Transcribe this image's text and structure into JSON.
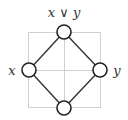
{
  "diagram": {
    "type": "hasse-diagram",
    "nodes": [
      {
        "id": "top",
        "label": "x ∨ y",
        "cx": 64,
        "cy": 32
      },
      {
        "id": "left",
        "label": "x",
        "cx": 29,
        "cy": 70
      },
      {
        "id": "right",
        "label": "y",
        "cx": 100,
        "cy": 70
      },
      {
        "id": "bottom",
        "label": "",
        "cx": 64,
        "cy": 108
      }
    ],
    "edges": [
      [
        "top",
        "left"
      ],
      [
        "top",
        "right"
      ],
      [
        "left",
        "bottom"
      ],
      [
        "right",
        "bottom"
      ]
    ],
    "colors": {
      "node_stroke": "#222222",
      "edge": "#333333",
      "grid": "#cccccc"
    }
  }
}
